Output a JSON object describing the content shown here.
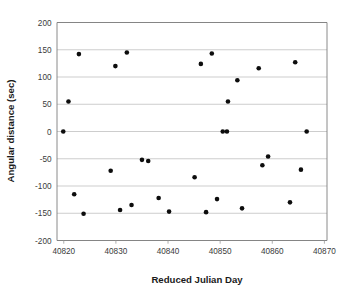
{
  "chart_data": {
    "type": "scatter",
    "title": "",
    "xlabel": "Reduced Julian Day",
    "ylabel": "Angular distance (sec)",
    "xlim": [
      40818.7,
      40870.5
    ],
    "ylim": [
      -200,
      200
    ],
    "xticks": [
      40820,
      40830,
      40840,
      40850,
      40860,
      40870
    ],
    "xtick_labels": [
      "40820",
      "40830",
      "40840",
      "40850",
      "40860",
      "40870"
    ],
    "yticks": [
      -200,
      -150,
      -100,
      -50,
      0,
      50,
      100,
      150,
      200
    ],
    "ytick_labels": [
      "-200",
      "-150",
      "-100",
      "-50",
      "0",
      "50",
      "100",
      "150",
      "200"
    ],
    "grid": "horizontal",
    "legend": "none",
    "marker": "filled-circle",
    "marker_color": "#0d0d0d",
    "marker_size": 4.6,
    "points": [
      {
        "x": 40819.9,
        "y": 0
      },
      {
        "x": 40820.9,
        "y": 55
      },
      {
        "x": 40822.0,
        "y": -115
      },
      {
        "x": 40822.9,
        "y": 142
      },
      {
        "x": 40823.8,
        "y": -151
      },
      {
        "x": 40829.0,
        "y": -72
      },
      {
        "x": 40829.9,
        "y": 120
      },
      {
        "x": 40830.8,
        "y": -144
      },
      {
        "x": 40832.1,
        "y": 145
      },
      {
        "x": 40833.0,
        "y": -135
      },
      {
        "x": 40835.0,
        "y": -52
      },
      {
        "x": 40836.2,
        "y": -54
      },
      {
        "x": 40838.2,
        "y": -122
      },
      {
        "x": 40840.2,
        "y": -147
      },
      {
        "x": 40845.1,
        "y": -84
      },
      {
        "x": 40846.3,
        "y": 124
      },
      {
        "x": 40847.3,
        "y": -148
      },
      {
        "x": 40848.4,
        "y": 143
      },
      {
        "x": 40849.4,
        "y": -124
      },
      {
        "x": 40850.5,
        "y": 0
      },
      {
        "x": 40851.3,
        "y": 0
      },
      {
        "x": 40851.5,
        "y": 55
      },
      {
        "x": 40853.3,
        "y": 94
      },
      {
        "x": 40854.2,
        "y": -141
      },
      {
        "x": 40857.4,
        "y": 116
      },
      {
        "x": 40858.1,
        "y": -62
      },
      {
        "x": 40859.2,
        "y": -46
      },
      {
        "x": 40863.4,
        "y": -130
      },
      {
        "x": 40864.4,
        "y": 127
      },
      {
        "x": 40865.5,
        "y": -70
      },
      {
        "x": 40866.6,
        "y": 0
      }
    ]
  },
  "plot": {
    "background": "#ffffff",
    "grid_color": "#b8b8b8",
    "axis_color": "#7d7d7d",
    "tick_text_color": "#3b3b3b",
    "title_text_color": "#1a1a1a"
  }
}
